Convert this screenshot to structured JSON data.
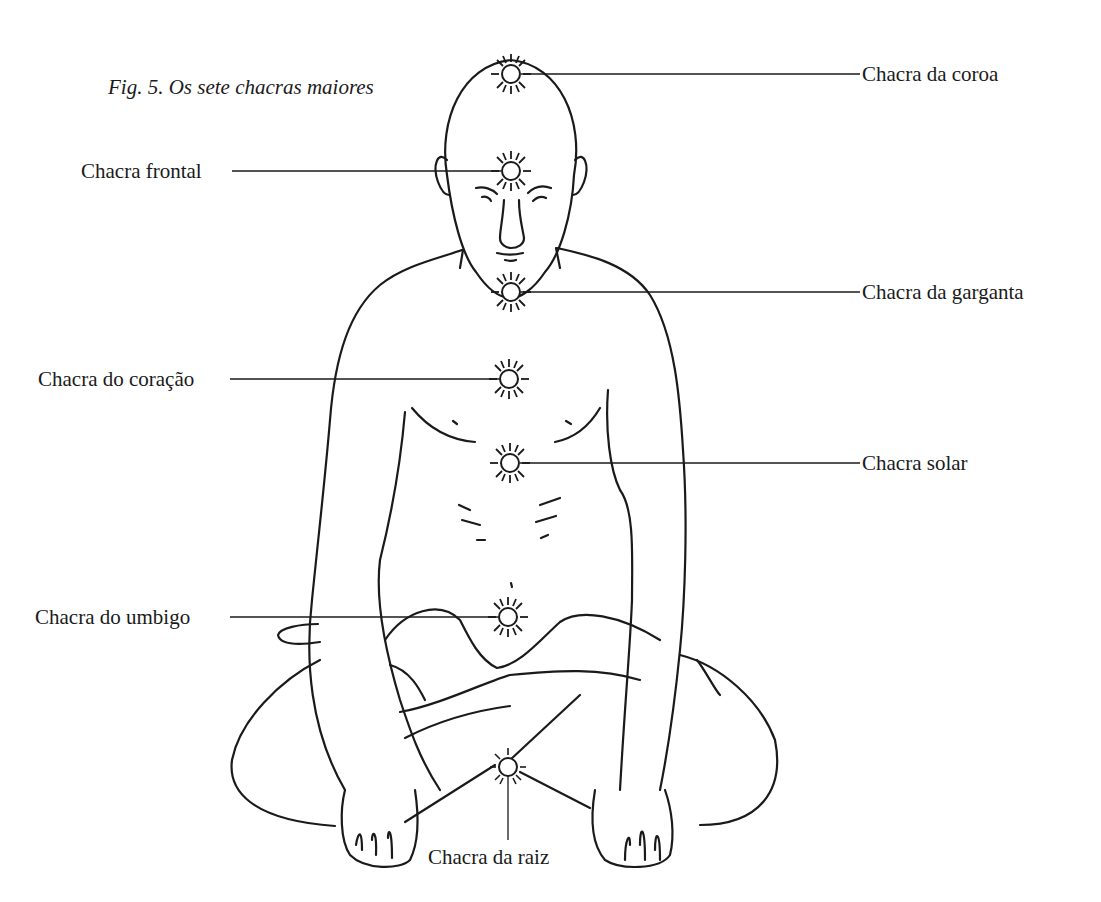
{
  "figure": {
    "caption": "Fig. 5.  Os sete chacras maiores"
  },
  "chakras": [
    {
      "id": "crown",
      "label": "Chacra da coroa",
      "side": "right",
      "x": 511,
      "y": 74
    },
    {
      "id": "frontal",
      "label": "Chacra frontal",
      "side": "left",
      "x": 511,
      "y": 171
    },
    {
      "id": "throat",
      "label": "Chacra da garganta",
      "side": "right",
      "x": 511,
      "y": 292
    },
    {
      "id": "heart",
      "label": "Chacra do coração",
      "side": "left",
      "x": 509,
      "y": 379
    },
    {
      "id": "solar",
      "label": "Chacra solar",
      "side": "right",
      "x": 510,
      "y": 463
    },
    {
      "id": "navel",
      "label": "Chacra do umbigo",
      "side": "left",
      "x": 508,
      "y": 617
    },
    {
      "id": "root",
      "label": "Chacra da raiz",
      "side": "bottom",
      "x": 508,
      "y": 767
    }
  ],
  "colors": {
    "ink": "#1a1a1a",
    "paper": "#ffffff"
  }
}
